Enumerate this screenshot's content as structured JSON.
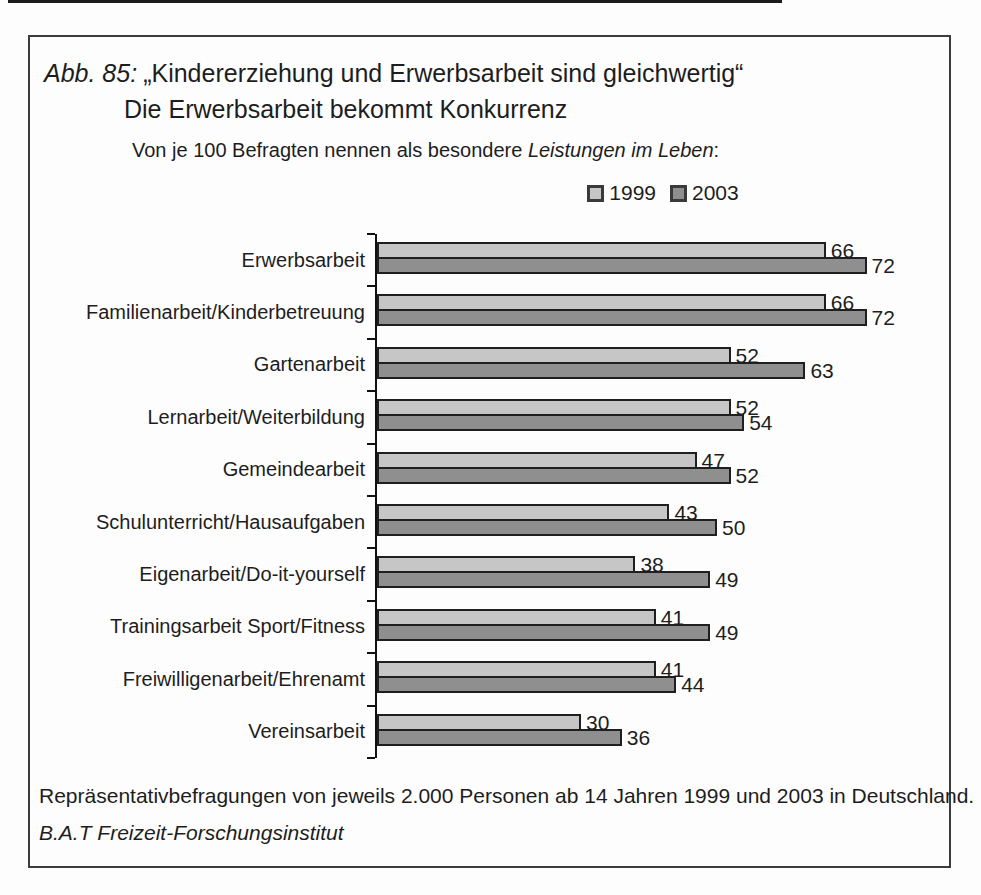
{
  "figure": {
    "label": "Abb. 85:",
    "title": "„Kindererziehung und Erwerbsarbeit sind gleichwertig“",
    "title_line2": "Die Erwerbsarbeit bekommt Konkurrenz",
    "subtitle": {
      "prefix": "Von je 100 Befragten nennen als besondere ",
      "italic": "Leistungen im Leben",
      "suffix": ":"
    },
    "footer_line1": "Repräsentativbefragungen von jeweils 2.000 Personen ab 14 Jahren 1999 und 2003 in Deutschland.",
    "footer_line2": "B.A.T Freizeit-Forschungsinstitut"
  },
  "legend": {
    "items": [
      {
        "label": "1999",
        "color": "#c6c6c6"
      },
      {
        "label": "2003",
        "color": "#8f8f8f"
      }
    ]
  },
  "colors": {
    "series_1999": "#c6c6c6",
    "series_2003": "#8f8f8f",
    "bar_outline": "#1f1f1f",
    "axis": "#111111",
    "frame_border": "#3c3c3c",
    "text": "#1d1d1d"
  },
  "chart_data": {
    "type": "bar",
    "orientation": "horizontal",
    "xlabel": "",
    "ylabel": "",
    "xlim": [
      0,
      85
    ],
    "grid": false,
    "legend_position": "top",
    "value_labels": true,
    "categories": [
      "Erwerbsarbeit",
      "Familienarbeit/Kinderbetreuung",
      "Gartenarbeit",
      "Lernarbeit/Weiterbildung",
      "Gemeindearbeit",
      "Schulunterricht/Hausaufgaben",
      "Eigenarbeit/Do-it-yourself",
      "Trainingsarbeit Sport/Fitness",
      "Freiwilligenarbeit/Ehrenamt",
      "Vereinsarbeit"
    ],
    "series": [
      {
        "name": "1999",
        "values": [
          66,
          66,
          52,
          52,
          47,
          43,
          38,
          41,
          41,
          30
        ]
      },
      {
        "name": "2003",
        "values": [
          72,
          72,
          63,
          54,
          52,
          50,
          49,
          49,
          44,
          36
        ]
      }
    ]
  }
}
